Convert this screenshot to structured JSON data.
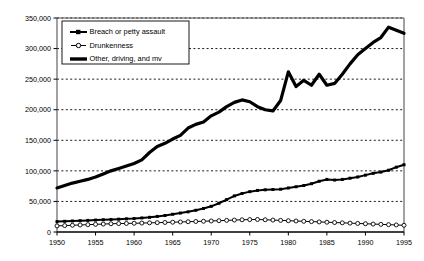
{
  "chart_data": {
    "type": "line",
    "title": "",
    "subtitle": "",
    "xlabel": "",
    "ylabel": "",
    "xlim": [
      1950,
      1995
    ],
    "ylim": [
      0,
      350000
    ],
    "grid": true,
    "grid_style": "dotted-horizontal",
    "legend_position": "top-left-inside",
    "x": [
      1950,
      1951,
      1952,
      1953,
      1954,
      1955,
      1956,
      1957,
      1958,
      1959,
      1960,
      1961,
      1962,
      1963,
      1964,
      1965,
      1966,
      1967,
      1968,
      1969,
      1970,
      1971,
      1972,
      1973,
      1974,
      1975,
      1976,
      1977,
      1978,
      1979,
      1980,
      1981,
      1982,
      1983,
      1984,
      1985,
      1986,
      1987,
      1988,
      1989,
      1990,
      1991,
      1992,
      1993,
      1994,
      1995
    ],
    "xticks": [
      1950,
      1955,
      1960,
      1965,
      1970,
      1975,
      1980,
      1985,
      1990,
      1995
    ],
    "xticklabels": [
      "1950",
      "1955",
      "1960",
      "1965",
      "1970",
      "1975",
      "1980",
      "1985",
      "1990",
      "1995"
    ],
    "yticks": [
      0,
      50000,
      100000,
      150000,
      200000,
      250000,
      300000,
      350000
    ],
    "yticklabels": [
      "0",
      "50,000",
      "100,000",
      "150,000",
      "200,000",
      "250,000",
      "300,000",
      "350,000"
    ],
    "series": [
      {
        "name": "Breach or petty assault",
        "marker": "filled-square",
        "line_color": "#000000",
        "line_width": 2.0,
        "values": [
          17000,
          17500,
          18000,
          18500,
          19000,
          19500,
          20000,
          20500,
          21000,
          21500,
          22000,
          23000,
          24000,
          25500,
          27000,
          29000,
          31000,
          33000,
          35500,
          38500,
          42000,
          47000,
          53000,
          59000,
          63000,
          66000,
          68000,
          69000,
          69500,
          70000,
          72000,
          74000,
          76000,
          79000,
          83000,
          86000,
          85000,
          86000,
          88000,
          90000,
          93000,
          96000,
          98000,
          101000,
          106000,
          110000
        ]
      },
      {
        "name": "Drunkenness",
        "marker": "open-circle",
        "line_color": "#000000",
        "line_width": 1.0,
        "values": [
          10000,
          10500,
          11000,
          11500,
          12000,
          12500,
          13000,
          13500,
          13800,
          14000,
          14300,
          14600,
          15000,
          15300,
          15600,
          16000,
          16400,
          16800,
          17200,
          17600,
          18000,
          18500,
          19000,
          19500,
          20000,
          20300,
          20500,
          20000,
          19500,
          19000,
          18500,
          18000,
          17500,
          17000,
          16500,
          16000,
          15500,
          15000,
          14500,
          14000,
          13500,
          13000,
          12500,
          12000,
          11500,
          11000
        ]
      },
      {
        "name": "Other, driving, and mv",
        "marker": "none",
        "line_color": "#000000",
        "line_width": 3.2,
        "values": [
          72000,
          76000,
          80000,
          83000,
          86000,
          90000,
          95000,
          100000,
          104000,
          108000,
          112000,
          118000,
          130000,
          140000,
          145000,
          152000,
          158000,
          170000,
          176000,
          180000,
          190000,
          196000,
          205000,
          212000,
          216000,
          213000,
          205000,
          200000,
          198000,
          215000,
          262000,
          238000,
          248000,
          240000,
          258000,
          240000,
          243000,
          258000,
          275000,
          290000,
          300000,
          310000,
          318000,
          335000,
          330000,
          325000
        ]
      }
    ]
  },
  "legend": {
    "items": [
      {
        "label": "Breach or petty assault",
        "marker": "filled-square"
      },
      {
        "label": "Drunkenness",
        "marker": "open-circle"
      },
      {
        "label": "Other, driving, and mv",
        "marker": "thick-line"
      }
    ]
  },
  "axes": {
    "y_title": "",
    "x_title": ""
  }
}
